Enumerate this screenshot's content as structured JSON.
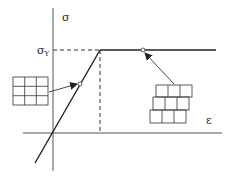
{
  "diagram": {
    "axes": {
      "y_label": "σ",
      "x_label": "ε",
      "yield_label": "σ",
      "yield_subscript": "Y"
    },
    "insets": [
      {
        "name": "ordered-lattice",
        "description": "3x3 regular grid (elastic region)"
      },
      {
        "name": "slipped-bricks",
        "description": "offset brick rows (plastic region)"
      }
    ],
    "colors": {
      "line": "#222222",
      "dashed": "#333333",
      "arrow": "#333333",
      "background": "#ffffff"
    }
  }
}
